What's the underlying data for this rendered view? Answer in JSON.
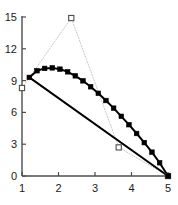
{
  "chart_data": {
    "type": "line",
    "title": "",
    "subtitle": "",
    "xlabel": "",
    "ylabel": "",
    "xlim": [
      1,
      5
    ],
    "ylim": [
      0,
      15
    ],
    "xticks": [
      1,
      2,
      3,
      4,
      5
    ],
    "yticks": [
      0,
      3,
      6,
      9,
      12,
      15
    ],
    "xtick_labels": [
      "1",
      "2",
      "3",
      "4",
      "5"
    ],
    "ytick_labels": [
      "0",
      "3",
      "6",
      "9",
      "12",
      "15"
    ],
    "grid": false,
    "legend": null,
    "legend_position": "none",
    "annotations": [],
    "axis_color": "#4d4d4d",
    "series": [
      {
        "name": "open-square-dotted",
        "style": "dotted",
        "color": "#c8c8c8",
        "marker": "open-square",
        "marker_color": "#4d4d4d",
        "linewidth": 1,
        "x": [
          1.0,
          2.35,
          3.65,
          5.0
        ],
        "y": [
          8.3,
          14.9,
          2.7,
          0.0
        ]
      },
      {
        "name": "filled-square-curve",
        "style": "solid",
        "color": "#000000",
        "marker": "filled-square",
        "marker_color": "#000000",
        "linewidth": 2,
        "x": [
          1.2,
          1.41,
          1.62,
          1.83,
          2.04,
          2.25,
          2.46,
          2.67,
          2.88,
          3.09,
          3.3,
          3.51,
          3.72,
          3.93,
          4.14,
          4.35,
          4.56,
          4.77,
          5.0
        ],
        "y": [
          9.3,
          9.93,
          10.15,
          10.2,
          10.08,
          9.83,
          9.45,
          8.98,
          8.42,
          7.8,
          7.12,
          6.4,
          5.63,
          4.84,
          4.01,
          3.15,
          2.25,
          1.25,
          0.0
        ]
      },
      {
        "name": "straight-line",
        "style": "solid",
        "color": "#000000",
        "marker": "none",
        "linewidth": 2,
        "x": [
          1.2,
          5.0
        ],
        "y": [
          9.3,
          0.0
        ]
      }
    ]
  }
}
